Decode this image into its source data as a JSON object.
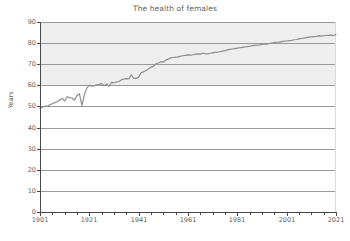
{
  "chart_data": {
    "type": "line",
    "title": "The health of females",
    "xlabel": "",
    "ylabel": "Years",
    "xlim": [
      1901,
      2021
    ],
    "ylim": [
      0,
      90
    ],
    "grid": true,
    "legend": "none",
    "line_color": "#8c8c8c",
    "band_color": "#eeeeee",
    "band_range": [
      60,
      90
    ],
    "y_ticks": [
      90,
      80,
      70,
      60,
      50,
      40,
      30,
      20,
      10,
      0
    ],
    "x_ticks_major": [
      1901,
      1921,
      1941,
      1961,
      1981,
      2001,
      2021
    ],
    "x_ticks_minor": [
      1906,
      1911,
      1916,
      1926,
      1931,
      1936,
      1946,
      1951,
      1956,
      1966,
      1971,
      1976,
      1986,
      1991,
      1996,
      2006,
      2011,
      2016
    ],
    "series": [
      {
        "name": "Female life expectancy",
        "x": [
          1901,
          1902,
          1903,
          1904,
          1905,
          1906,
          1907,
          1908,
          1909,
          1910,
          1911,
          1912,
          1913,
          1914,
          1915,
          1916,
          1917,
          1918,
          1919,
          1920,
          1921,
          1922,
          1923,
          1924,
          1925,
          1926,
          1927,
          1928,
          1929,
          1930,
          1931,
          1932,
          1933,
          1934,
          1935,
          1936,
          1937,
          1938,
          1939,
          1940,
          1941,
          1942,
          1943,
          1944,
          1945,
          1946,
          1947,
          1948,
          1949,
          1950,
          1951,
          1952,
          1953,
          1954,
          1955,
          1956,
          1957,
          1958,
          1959,
          1960,
          1961,
          1962,
          1963,
          1964,
          1965,
          1966,
          1967,
          1968,
          1969,
          1970,
          1971,
          1972,
          1973,
          1974,
          1975,
          1976,
          1977,
          1978,
          1979,
          1980,
          1981,
          1982,
          1983,
          1984,
          1985,
          1986,
          1987,
          1988,
          1989,
          1990,
          1991,
          1992,
          1993,
          1994,
          1995,
          1996,
          1997,
          1998,
          1999,
          2000,
          2001,
          2002,
          2003,
          2004,
          2005,
          2006,
          2007,
          2008,
          2009,
          2010,
          2011,
          2012,
          2013,
          2014,
          2015,
          2016,
          2017,
          2018,
          2019,
          2020,
          2021
        ],
        "values": [
          49.0,
          49.6,
          50.2,
          50.0,
          50.8,
          51.3,
          51.8,
          52.2,
          53.2,
          53.8,
          52.6,
          54.6,
          54.2,
          54.0,
          53.0,
          55.2,
          56.0,
          50.4,
          55.6,
          58.8,
          60.0,
          59.6,
          59.8,
          60.2,
          60.4,
          60.8,
          59.8,
          60.6,
          59.6,
          61.4,
          61.2,
          61.6,
          61.8,
          62.6,
          63.0,
          63.2,
          63.0,
          65.0,
          63.4,
          63.2,
          64.0,
          66.0,
          66.4,
          67.0,
          67.8,
          68.6,
          69.0,
          70.2,
          70.6,
          71.2,
          71.0,
          72.0,
          72.4,
          73.0,
          73.2,
          73.4,
          73.5,
          73.8,
          74.0,
          74.2,
          74.4,
          74.3,
          74.5,
          74.8,
          74.9,
          74.8,
          75.2,
          75.0,
          74.9,
          75.2,
          75.4,
          75.6,
          75.7,
          75.9,
          76.2,
          76.4,
          76.8,
          77.0,
          77.2,
          77.4,
          77.6,
          77.8,
          78.0,
          78.2,
          78.3,
          78.5,
          78.8,
          78.9,
          79.0,
          79.2,
          79.4,
          79.6,
          79.5,
          79.8,
          80.0,
          80.2,
          80.4,
          80.5,
          80.7,
          80.9,
          81.0,
          81.2,
          81.3,
          81.6,
          81.7,
          82.0,
          82.2,
          82.4,
          82.6,
          82.8,
          83.0,
          83.1,
          83.2,
          83.4,
          83.3,
          83.5,
          83.6,
          83.7,
          83.8,
          83.6,
          84.0
        ]
      }
    ]
  }
}
